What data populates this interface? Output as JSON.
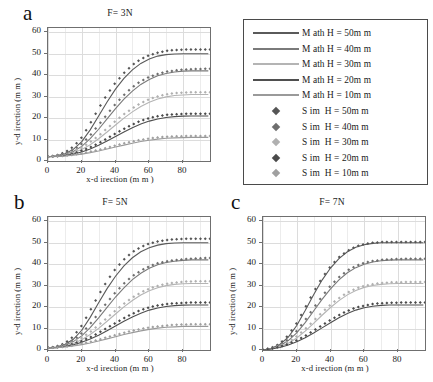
{
  "figure": {
    "axis_x_title": "x-d irection  (m m )",
    "axis_y_title": "y-d irection  (m m )",
    "xticks": [
      "0",
      "20",
      "40",
      "60",
      "80"
    ],
    "yticks": [
      "0",
      "10",
      "20",
      "30",
      "40",
      "50",
      "60"
    ]
  },
  "panels": [
    {
      "letter": "a",
      "title": "F= 3N"
    },
    {
      "letter": "b",
      "title": "F= 5N"
    },
    {
      "letter": "c",
      "title": "F= 7N"
    }
  ],
  "legend": {
    "entries": [
      {
        "label": "M ath H = 50m m",
        "type": "line",
        "color": "#5a5a5a"
      },
      {
        "label": "M ath H = 40m m",
        "type": "line",
        "color": "#7a7a7a"
      },
      {
        "label": "M ath H = 30m m",
        "type": "line",
        "color": "#b4b4b4"
      },
      {
        "label": "M ath H = 20m m",
        "type": "line",
        "color": "#4f4f4f"
      },
      {
        "label": "M ath H = 10m m",
        "type": "line",
        "color": "#9a9a9a"
      },
      {
        "label": "S im  H = 50m m",
        "type": "marker",
        "color": "#555555"
      },
      {
        "label": "S im  H = 40m m",
        "type": "marker",
        "color": "#6e6e6e"
      },
      {
        "label": "S im  H = 30m m",
        "type": "marker",
        "color": "#b0b0b0"
      },
      {
        "label": "S im  H = 20m m",
        "type": "marker",
        "color": "#4a4a4a"
      },
      {
        "label": "S im  H = 10m m",
        "type": "marker",
        "color": "#a0a0a0"
      }
    ]
  },
  "chart_data": [
    {
      "type": "line",
      "title": "F= 3N",
      "panel": "a",
      "xlabel": "x-direction (mm)",
      "ylabel": "y-direction (mm)",
      "xlim": [
        0,
        96
      ],
      "ylim": [
        0,
        62
      ],
      "grid": true,
      "legend_position": "external-top-right",
      "x": [
        0,
        5,
        10,
        15,
        20,
        25,
        30,
        35,
        40,
        45,
        50,
        55,
        60,
        65,
        70,
        75,
        80,
        85,
        90,
        95
      ],
      "series": [
        {
          "name": "Math H=50mm",
          "style": "line",
          "color": "#5a5a5a",
          "values": [
            2,
            2.4,
            3.4,
            5.4,
            9.0,
            14.5,
            21.0,
            27.5,
            33.5,
            38.5,
            42.5,
            45.5,
            47.6,
            48.9,
            49.6,
            49.9,
            50.0,
            50.0,
            50.0,
            50.0
          ]
        },
        {
          "name": "Math H=40mm",
          "style": "line",
          "color": "#7a7a7a",
          "values": [
            2,
            2.3,
            3.0,
            4.4,
            6.8,
            10.4,
            14.8,
            19.6,
            24.4,
            28.8,
            32.6,
            35.7,
            38.0,
            39.7,
            40.8,
            41.5,
            41.9,
            42.0,
            42.0,
            42.0
          ]
        },
        {
          "name": "Math H=30mm",
          "style": "line",
          "color": "#b4b4b4",
          "values": [
            2,
            2.2,
            2.8,
            3.8,
            5.4,
            7.6,
            10.4,
            13.5,
            16.8,
            20.0,
            22.9,
            25.4,
            27.4,
            28.9,
            29.9,
            30.5,
            30.8,
            31.0,
            31.0,
            31.0
          ]
        },
        {
          "name": "Math H=20mm",
          "style": "line",
          "color": "#4f4f4f",
          "values": [
            2,
            2.1,
            2.5,
            3.2,
            4.2,
            5.6,
            7.3,
            9.3,
            11.4,
            13.5,
            15.5,
            17.2,
            18.6,
            19.6,
            20.3,
            20.7,
            20.9,
            21.0,
            21.0,
            21.0
          ]
        },
        {
          "name": "Math H=10mm",
          "style": "line",
          "color": "#9a9a9a",
          "values": [
            2,
            2.1,
            2.3,
            2.7,
            3.2,
            3.9,
            4.7,
            5.6,
            6.5,
            7.4,
            8.3,
            9.1,
            9.7,
            10.2,
            10.6,
            10.8,
            10.9,
            11.0,
            11.0,
            11.0
          ]
        },
        {
          "name": "Sim H=50mm",
          "style": "marker",
          "color": "#555555",
          "values": [
            2,
            2.6,
            4.0,
            6.6,
            11.0,
            17.5,
            24.5,
            31.0,
            36.5,
            41.0,
            44.8,
            47.5,
            49.3,
            50.5,
            51.3,
            51.7,
            51.9,
            52.0,
            52.0,
            52.0
          ]
        },
        {
          "name": "Sim H=40mm",
          "style": "marker",
          "color": "#6e6e6e",
          "values": [
            2,
            2.4,
            3.4,
            5.2,
            8.0,
            12.0,
            16.8,
            21.8,
            26.6,
            30.8,
            34.4,
            37.2,
            39.2,
            40.6,
            41.6,
            42.2,
            42.6,
            42.8,
            42.9,
            43.0
          ]
        },
        {
          "name": "Sim H=30mm",
          "style": "marker",
          "color": "#b0b0b0",
          "values": [
            2,
            2.3,
            3.0,
            4.2,
            6.2,
            8.8,
            11.8,
            15.2,
            18.6,
            21.8,
            24.6,
            27.0,
            28.8,
            30.1,
            31.0,
            31.6,
            31.9,
            32.0,
            32.0,
            32.0
          ]
        },
        {
          "name": "Sim H=20mm",
          "style": "marker",
          "color": "#4a4a4a",
          "values": [
            2,
            2.2,
            2.7,
            3.5,
            4.8,
            6.4,
            8.3,
            10.5,
            12.8,
            15.0,
            17.0,
            18.7,
            20.0,
            20.9,
            21.5,
            21.8,
            22.0,
            22.0,
            22.0,
            22.0
          ]
        },
        {
          "name": "Sim H=10mm",
          "style": "marker",
          "color": "#a0a0a0",
          "values": [
            2,
            2.1,
            2.4,
            2.9,
            3.5,
            4.3,
            5.2,
            6.2,
            7.2,
            8.2,
            9.1,
            9.9,
            10.5,
            11.0,
            11.3,
            11.5,
            11.6,
            11.7,
            11.7,
            11.7
          ]
        }
      ]
    },
    {
      "type": "line",
      "title": "F= 5N",
      "panel": "b",
      "xlabel": "x-direction (mm)",
      "ylabel": "y-direction (mm)",
      "xlim": [
        0,
        96
      ],
      "ylim": [
        0,
        62
      ],
      "grid": true,
      "x": [
        0,
        5,
        10,
        15,
        20,
        25,
        30,
        35,
        40,
        45,
        50,
        55,
        60,
        65,
        70,
        75,
        80,
        85,
        90,
        95
      ],
      "series": [
        {
          "name": "Math H=50mm",
          "style": "line",
          "color": "#5a5a5a",
          "values": [
            1,
            1.4,
            2.6,
            5.0,
            9.2,
            15.2,
            22.0,
            28.6,
            34.4,
            39.2,
            43.0,
            45.8,
            47.7,
            48.9,
            49.6,
            49.9,
            50.0,
            50.0,
            50.0,
            50.0
          ]
        },
        {
          "name": "Math H=40mm",
          "style": "line",
          "color": "#7a7a7a",
          "values": [
            1,
            1.3,
            2.2,
            3.9,
            6.6,
            10.4,
            15.0,
            19.9,
            24.7,
            29.0,
            32.8,
            35.8,
            38.1,
            39.7,
            40.8,
            41.4,
            41.8,
            42.0,
            42.0,
            42.0
          ]
        },
        {
          "name": "Math H=30mm",
          "style": "line",
          "color": "#b4b4b4",
          "values": [
            1,
            1.2,
            1.9,
            3.0,
            4.8,
            7.2,
            10.1,
            13.4,
            16.8,
            20.1,
            23.1,
            25.6,
            27.6,
            29.0,
            30.0,
            30.6,
            30.9,
            31.0,
            31.0,
            31.0
          ]
        },
        {
          "name": "Math H=20mm",
          "style": "line",
          "color": "#4f4f4f",
          "values": [
            1,
            1.1,
            1.6,
            2.4,
            3.6,
            5.1,
            6.9,
            9.0,
            11.2,
            13.4,
            15.4,
            17.1,
            18.6,
            19.6,
            20.3,
            20.7,
            20.9,
            21.0,
            21.0,
            21.0
          ]
        },
        {
          "name": "Math H=10mm",
          "style": "line",
          "color": "#9a9a9a",
          "values": [
            1,
            1.1,
            1.4,
            1.9,
            2.5,
            3.3,
            4.2,
            5.2,
            6.2,
            7.2,
            8.1,
            8.9,
            9.6,
            10.2,
            10.6,
            10.8,
            11.0,
            11.0,
            11.0,
            11.0
          ]
        },
        {
          "name": "Sim H=50mm",
          "style": "marker",
          "color": "#555555",
          "values": [
            1,
            1.6,
            3.2,
            6.2,
            11.4,
            18.4,
            25.6,
            32.2,
            37.8,
            42.2,
            45.6,
            48.0,
            49.6,
            50.6,
            51.2,
            51.6,
            51.8,
            51.9,
            51.9,
            51.9
          ]
        },
        {
          "name": "Sim H=40mm",
          "style": "marker",
          "color": "#6e6e6e",
          "values": [
            1,
            1.4,
            2.6,
            4.6,
            7.8,
            12.2,
            17.2,
            22.2,
            26.9,
            31.0,
            34.4,
            37.0,
            39.0,
            40.4,
            41.3,
            41.9,
            42.3,
            42.6,
            42.8,
            42.9
          ]
        },
        {
          "name": "Sim H=30mm",
          "style": "marker",
          "color": "#b0b0b0",
          "values": [
            1,
            1.3,
            2.2,
            3.6,
            5.7,
            8.4,
            11.6,
            15.0,
            18.4,
            21.6,
            24.4,
            26.8,
            28.6,
            29.9,
            30.8,
            31.4,
            31.8,
            32.0,
            32.0,
            32.0
          ]
        },
        {
          "name": "Sim H=20mm",
          "style": "marker",
          "color": "#4a4a4a",
          "values": [
            1,
            1.2,
            1.8,
            2.8,
            4.2,
            5.9,
            8.0,
            10.3,
            12.6,
            14.9,
            16.9,
            18.6,
            19.9,
            20.8,
            21.4,
            21.8,
            22.0,
            22.1,
            22.1,
            22.1
          ]
        },
        {
          "name": "Sim H=10mm",
          "style": "marker",
          "color": "#a0a0a0",
          "values": [
            1,
            1.1,
            1.5,
            2.1,
            2.9,
            3.8,
            4.8,
            5.9,
            7.0,
            8.0,
            9.0,
            9.8,
            10.5,
            11.0,
            11.4,
            11.7,
            11.9,
            12.0,
            12.0,
            12.0
          ]
        }
      ]
    },
    {
      "type": "line",
      "title": "F= 7N",
      "panel": "c",
      "xlabel": "x-direction (mm)",
      "ylabel": "y-direction (mm)",
      "xlim": [
        0,
        96
      ],
      "ylim": [
        0,
        62
      ],
      "grid": true,
      "x": [
        0,
        5,
        10,
        15,
        20,
        25,
        30,
        35,
        40,
        45,
        50,
        55,
        60,
        65,
        70,
        75,
        80,
        85,
        90,
        95
      ],
      "series": [
        {
          "name": "Math H=50mm",
          "style": "line",
          "color": "#5a5a5a",
          "values": [
            0,
            0.8,
            2.6,
            6.0,
            11.4,
            18.4,
            25.8,
            32.6,
            38.2,
            42.6,
            45.8,
            47.9,
            49.1,
            49.7,
            50.0,
            50.0,
            50.0,
            50.0,
            50.0,
            50.0
          ]
        },
        {
          "name": "Math H=40mm",
          "style": "line",
          "color": "#7a7a7a",
          "values": [
            0,
            0.7,
            2.0,
            4.4,
            8.0,
            12.8,
            18.2,
            23.6,
            28.5,
            32.7,
            36.0,
            38.4,
            40.0,
            41.0,
            41.6,
            41.9,
            42.0,
            42.0,
            42.0,
            42.0
          ]
        },
        {
          "name": "Math H=30mm",
          "style": "line",
          "color": "#b4b4b4",
          "values": [
            0,
            0.6,
            1.6,
            3.2,
            5.6,
            8.8,
            12.4,
            16.2,
            19.8,
            23.0,
            25.7,
            27.7,
            29.2,
            30.1,
            30.6,
            30.9,
            31.0,
            31.0,
            31.0,
            31.0
          ]
        },
        {
          "name": "Math H=20mm",
          "style": "line",
          "color": "#4f4f4f",
          "values": [
            0,
            0.5,
            1.2,
            2.3,
            3.8,
            5.7,
            7.9,
            10.3,
            12.7,
            15.0,
            17.0,
            18.6,
            19.7,
            20.4,
            20.8,
            21.0,
            21.0,
            21.0,
            21.0,
            21.0
          ]
        },
        {
          "name": "Sim H=50mm",
          "style": "marker",
          "color": "#555555",
          "values": [
            0,
            1.0,
            3.0,
            6.8,
            12.6,
            19.8,
            27.0,
            33.6,
            39.0,
            43.2,
            46.2,
            48.2,
            49.4,
            50.0,
            50.3,
            50.4,
            50.4,
            50.4,
            50.4,
            50.4
          ]
        },
        {
          "name": "Sim H=40mm",
          "style": "marker",
          "color": "#6e6e6e",
          "values": [
            0,
            0.8,
            2.3,
            5.0,
            8.9,
            14.0,
            19.6,
            25.0,
            29.9,
            33.9,
            37.0,
            39.2,
            40.6,
            41.5,
            42.0,
            42.3,
            42.4,
            42.5,
            42.5,
            42.5
          ]
        },
        {
          "name": "Sim H=30mm",
          "style": "marker",
          "color": "#b0b0b0",
          "values": [
            0,
            0.7,
            1.9,
            3.8,
            6.4,
            9.8,
            13.6,
            17.5,
            21.1,
            24.2,
            26.7,
            28.6,
            29.9,
            30.7,
            31.2,
            31.5,
            31.6,
            31.7,
            31.7,
            31.7
          ]
        },
        {
          "name": "Sim H=20mm",
          "style": "marker",
          "color": "#4a4a4a",
          "values": [
            0,
            0.6,
            1.5,
            2.8,
            4.5,
            6.6,
            9.0,
            11.5,
            14.0,
            16.3,
            18.2,
            19.7,
            20.7,
            21.4,
            21.8,
            22.0,
            22.1,
            22.1,
            22.1,
            22.1
          ]
        }
      ]
    }
  ]
}
